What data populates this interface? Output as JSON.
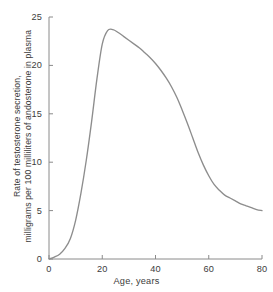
{
  "chart_data": {
    "type": "line",
    "title": "",
    "xlabel": "Age, years",
    "ylabel_line1": "Rate of testosterone secretion,",
    "ylabel_line2": "milligrams per 100 milliliters of andosterone in plasma",
    "xlim": [
      0,
      80
    ],
    "ylim": [
      0,
      25
    ],
    "grid": false,
    "legend": "none",
    "xticks": [
      "0",
      "20",
      "40",
      "60",
      "80"
    ],
    "xtick_values": [
      0,
      20,
      40,
      60,
      80
    ],
    "yticks": [
      "0",
      "5",
      "10",
      "15",
      "20",
      "25"
    ],
    "ytick_values": [
      0,
      5,
      10,
      15,
      20,
      25
    ],
    "series": [
      {
        "name": "Testosterone secretion rate",
        "color": "#8d8d8d",
        "x": [
          0,
          2,
          4,
          6,
          8,
          10,
          12,
          14,
          16,
          18,
          20,
          22,
          24,
          26,
          28,
          30,
          32,
          34,
          36,
          38,
          40,
          42,
          44,
          46,
          48,
          50,
          52,
          54,
          56,
          58,
          60,
          62,
          64,
          66,
          68,
          70,
          72,
          74,
          76,
          78,
          80
        ],
        "y": [
          0.0,
          0.2,
          0.5,
          1.1,
          2.1,
          4.0,
          6.8,
          10.2,
          14.2,
          18.6,
          22.2,
          23.6,
          23.7,
          23.4,
          23.0,
          22.6,
          22.2,
          21.8,
          21.3,
          20.8,
          20.2,
          19.5,
          18.7,
          17.8,
          16.7,
          15.4,
          14.0,
          12.5,
          11.0,
          9.7,
          8.6,
          7.7,
          7.1,
          6.6,
          6.3,
          6.0,
          5.7,
          5.5,
          5.3,
          5.1,
          5.0
        ]
      }
    ],
    "annotations": {
      "peak_value": "23.7",
      "peak_age": "23",
      "end_value": "5.0",
      "start_value": "0"
    },
    "colors": {
      "curve": "#8d8d8d",
      "axis": "#8a8a8a",
      "text": "#3c3c3c",
      "background": "#ffffff"
    }
  }
}
